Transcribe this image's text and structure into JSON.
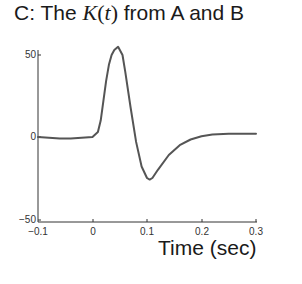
{
  "title": {
    "prefix": "C: The ",
    "math_symbol": "K",
    "math_open": "(",
    "math_var": "t",
    "math_close": ")",
    "suffix": " from A and B"
  },
  "axes": {
    "xlabel": "Time (sec)",
    "yticks": [
      "50",
      "0",
      "−50"
    ],
    "xticks": [
      "−0.1",
      "0",
      "0.1",
      "0.2",
      "0.3"
    ]
  },
  "colors": {
    "line": "#555555",
    "axis": "#333333"
  },
  "chart_data": {
    "type": "line",
    "title": "C: The K(t) from A and B",
    "xlabel": "Time (sec)",
    "ylabel": "",
    "xlim": [
      -0.1,
      0.3
    ],
    "ylim": [
      -50,
      50
    ],
    "xticks": [
      -0.1,
      0,
      0.1,
      0.2,
      0.3
    ],
    "yticks": [
      -50,
      0,
      50
    ],
    "grid": false,
    "legend": null,
    "series": [
      {
        "name": "K(t)",
        "x": [
          -0.1,
          -0.08,
          -0.06,
          -0.04,
          -0.02,
          0.0,
          0.01,
          0.015,
          0.02,
          0.025,
          0.03,
          0.035,
          0.04,
          0.047,
          0.055,
          0.06,
          0.07,
          0.08,
          0.09,
          0.1,
          0.105,
          0.11,
          0.12,
          0.14,
          0.16,
          0.18,
          0.2,
          0.22,
          0.25,
          0.3
        ],
        "values": [
          0,
          -0.5,
          -1,
          -1,
          -0.5,
          0,
          3,
          10,
          22,
          34,
          44,
          50,
          53,
          55,
          50,
          40,
          18,
          -3,
          -18,
          -25,
          -26,
          -25,
          -20,
          -11,
          -5,
          -1.5,
          0.5,
          1.5,
          2,
          2
        ]
      }
    ]
  }
}
